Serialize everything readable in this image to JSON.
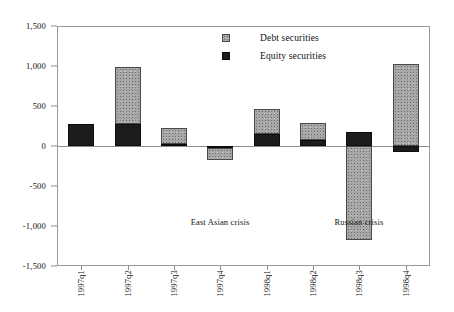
{
  "chart_data": {
    "type": "bar",
    "stacked": true,
    "title": "",
    "subtitle": "",
    "xlabel": "",
    "ylabel": "",
    "ylim": [
      -1500,
      1500
    ],
    "ytick_labels": [
      "1,500",
      "1,000",
      "500",
      "0",
      "-500",
      "-1,000",
      "-1,500"
    ],
    "ytick_values": [
      1500,
      1000,
      500,
      0,
      -500,
      -1000,
      -1500
    ],
    "grid": false,
    "legend_position": "top-center",
    "categories": [
      "1997q1",
      "1997q2",
      "1997q3",
      "1997q4",
      "1998q1",
      "1998q2",
      "1998q3",
      "1998q4"
    ],
    "series": [
      {
        "name": "Equity securities",
        "color": "#1c1c1c",
        "values": [
          270,
          275,
          25,
          -20,
          150,
          75,
          170,
          -70
        ]
      },
      {
        "name": "Debt securities",
        "color": "#a8a8a8",
        "values": [
          0,
          715,
          195,
          -155,
          310,
          215,
          -1170,
          1020
        ]
      }
    ],
    "totals": [
      270,
      990,
      220,
      -175,
      460,
      290,
      -1000,
      950
    ],
    "annotations": [
      {
        "text": "East Asian crisis",
        "x_category": "1997q4",
        "y_value": -890
      },
      {
        "text": "Russian crisis",
        "x_category": "1998q3",
        "y_value": -890
      }
    ]
  },
  "legend": {
    "items": [
      {
        "label": "Debt securities",
        "swatch": "debt-swatch"
      },
      {
        "label": "Equity securities",
        "swatch": "equity-swatch"
      }
    ]
  }
}
